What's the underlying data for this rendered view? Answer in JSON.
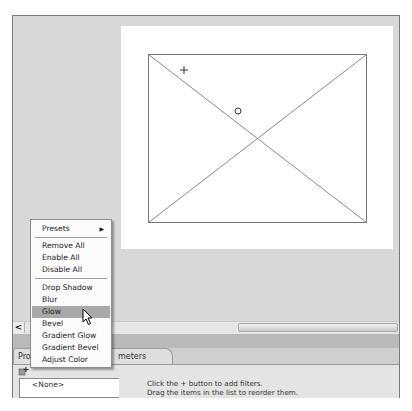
{
  "stage": {
    "plus_marker": "+",
    "circle_marker": "o"
  },
  "scrollbar": {
    "left_arrow": "<"
  },
  "panel": {
    "tabs": [
      {
        "label": "Prop"
      },
      {
        "label": "meters"
      }
    ],
    "add_button_icon": "add-filter-icon",
    "filter_list": [
      "<None>"
    ],
    "hint_lines": [
      "Click the + button to add filters.",
      "Drag  the items in the list to reorder them."
    ]
  },
  "context_menu": {
    "items": [
      {
        "label": "Presets",
        "submenu": true
      },
      {
        "label": "Remove All"
      },
      {
        "label": "Enable All"
      },
      {
        "label": "Disable All"
      },
      {
        "label": "Drop Shadow"
      },
      {
        "label": "Blur"
      },
      {
        "label": "Glow",
        "highlighted": true
      },
      {
        "label": "Bevel"
      },
      {
        "label": "Gradient Glow"
      },
      {
        "label": "Gradient Bevel"
      },
      {
        "label": "Adjust Color"
      }
    ],
    "submenu_arrow": "▶"
  }
}
